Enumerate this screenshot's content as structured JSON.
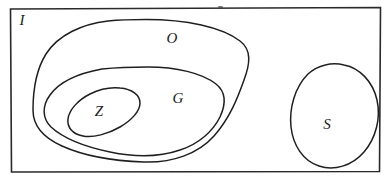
{
  "diagram": {
    "kind": "euler-diagram",
    "style": "hand-drawn",
    "background_color": "#ffffff",
    "stroke_color": "#1f1f1f",
    "label_color": "#1a1a1a",
    "canvas": {
      "width": 388,
      "height": 183
    },
    "frame": {
      "name": "universe-rectangle",
      "label": "I",
      "label_x": 22,
      "label_y": 22,
      "x": 10,
      "y": 8,
      "width": 370,
      "height": 164
    },
    "sets": [
      {
        "id": "O",
        "label": "O",
        "label_x": 172,
        "label_y": 40,
        "shape": "blob",
        "contains": [
          "G",
          "Z"
        ]
      },
      {
        "id": "G",
        "label": "G",
        "label_x": 178,
        "label_y": 100,
        "shape": "blob",
        "contains": [
          "Z"
        ]
      },
      {
        "id": "Z",
        "label": "Z",
        "label_x": 99,
        "label_y": 113,
        "shape": "ellipse",
        "contains": []
      },
      {
        "id": "S",
        "label": "S",
        "label_x": 327,
        "label_y": 126,
        "shape": "ellipse",
        "contains": []
      }
    ]
  }
}
